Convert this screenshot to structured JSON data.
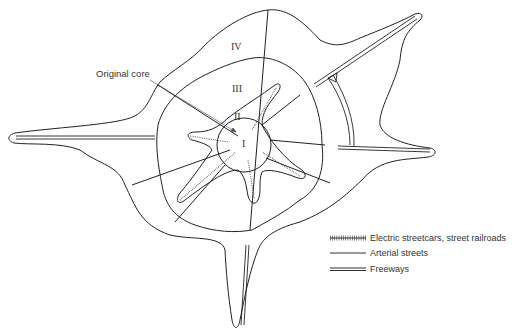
{
  "diagram": {
    "type": "urban growth zones diagram",
    "zones": [
      {
        "id": "I",
        "label": "I"
      },
      {
        "id": "II",
        "label": "II"
      },
      {
        "id": "III",
        "label": "III"
      },
      {
        "id": "IV",
        "label": "IV"
      }
    ],
    "annotation": {
      "label": "Original core"
    },
    "legend": [
      {
        "symbol": "hatched-line",
        "label": "Electric streetcars, street railroads"
      },
      {
        "symbol": "single-line",
        "label": "Arterial streets"
      },
      {
        "symbol": "double-line",
        "label": "Freeways"
      }
    ],
    "colors": {
      "stroke": "#222222",
      "background": "#ffffff"
    }
  }
}
